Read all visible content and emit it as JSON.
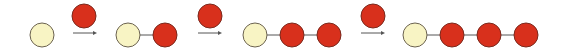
{
  "diagram": {
    "title": "",
    "colors": {
      "initial_node_fill": "#f8f4c4",
      "initial_node_stroke": "#6b6250",
      "added_node_fill": "#d8301c",
      "added_node_stroke": "#7a2a1e",
      "edge": "#555555",
      "arrow": "#555555"
    },
    "steps": [
      {
        "chain": [
          "cream"
        ],
        "incoming": "red"
      },
      {
        "chain": [
          "cream",
          "red"
        ],
        "incoming": "red"
      },
      {
        "chain": [
          "cream",
          "red",
          "red"
        ],
        "incoming": "red"
      },
      {
        "chain": [
          "cream",
          "red",
          "red",
          "red"
        ],
        "incoming": null
      }
    ]
  }
}
